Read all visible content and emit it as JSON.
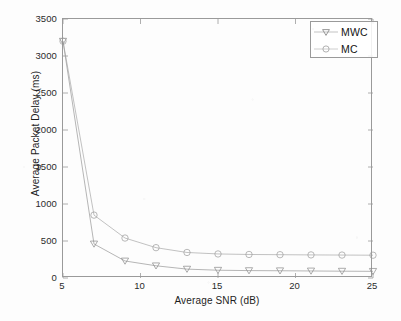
{
  "chart_data": {
    "type": "line",
    "title": "",
    "xlabel": "Average SNR (dB)",
    "ylabel": "Average Packet Delay (ms)",
    "xlim": [
      5,
      25
    ],
    "ylim": [
      0,
      3500
    ],
    "xticks": [
      5,
      10,
      15,
      20,
      25
    ],
    "yticks": [
      0,
      500,
      1000,
      1500,
      2000,
      2500,
      3000,
      3500
    ],
    "xtick_labels": [
      "5",
      "10",
      "15",
      "20",
      "25"
    ],
    "ytick_labels": [
      "0",
      "500",
      "1000",
      "1500",
      "2000",
      "2500",
      "3000",
      "3500"
    ],
    "grid": false,
    "legend_position": "upper-right",
    "x": [
      5,
      7,
      9,
      11,
      13,
      15,
      17,
      19,
      21,
      23,
      25
    ],
    "series": [
      {
        "name": "MWC",
        "marker": "triangle-down",
        "color": "#8c8c8c",
        "values": [
          3200,
          460,
          230,
          165,
          120,
          105,
          100,
          98,
          95,
          92,
          90
        ]
      },
      {
        "name": "MC",
        "marker": "circle",
        "color": "#9e9e9e",
        "values": [
          3200,
          850,
          540,
          410,
          345,
          325,
          318,
          315,
          312,
          310,
          308
        ]
      }
    ]
  },
  "legend": {
    "entries": [
      {
        "label": "MWC",
        "marker": "triangle-down"
      },
      {
        "label": "MC",
        "marker": "circle"
      }
    ]
  },
  "axes": {
    "x_title": "Average SNR (dB)",
    "y_title": "Average Packet Delay (ms)"
  },
  "style": {
    "axis_color": "#9a9a9a",
    "text_color": "#1d1d1d",
    "line_color": "#9e9e9e",
    "background": "#fdfdfd"
  }
}
